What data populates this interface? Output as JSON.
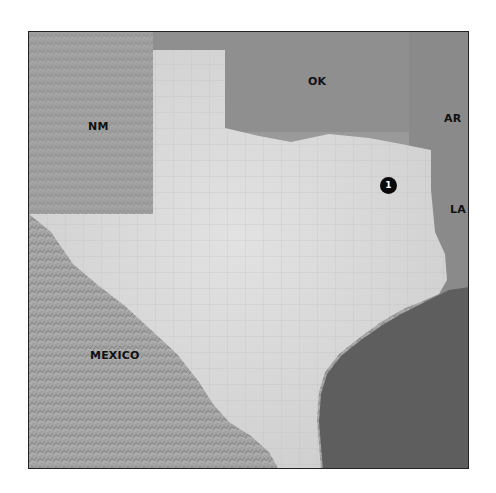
{
  "map": {
    "type": "shaded-relief reference map",
    "region_highlighted": "Texas",
    "labels": [
      {
        "id": "nm",
        "text": "NM",
        "x": 88,
        "y": 120
      },
      {
        "id": "ok",
        "text": "OK",
        "x": 308,
        "y": 75
      },
      {
        "id": "ar",
        "text": "AR",
        "x": 444,
        "y": 112
      },
      {
        "id": "la",
        "text": "LA",
        "x": 450,
        "y": 203
      },
      {
        "id": "mexico",
        "text": "MEXICO",
        "x": 90,
        "y": 349
      }
    ],
    "markers": [
      {
        "id": "site-1",
        "text": "1",
        "x": 380,
        "y": 177
      }
    ],
    "colors": {
      "highlight_land": "#d6d6d6",
      "surrounding_land": "#8e8e8e",
      "water": "#5c5c5c",
      "border": "#222222",
      "marker": "#0a0a0a"
    }
  }
}
